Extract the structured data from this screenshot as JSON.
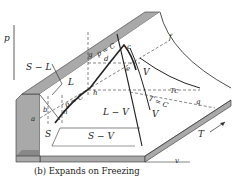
{
  "caption": "(b) Expands on Freezing",
  "axes": {
    "p": "p",
    "v": "v",
    "T": "T"
  },
  "regions": {
    "sl": "S − L",
    "l": "L",
    "lv": "L − V",
    "sv": "S − V",
    "s": "S",
    "v1": "V",
    "v2": "V"
  },
  "points": {
    "a": "a",
    "b": "b",
    "c": "c",
    "d": "d",
    "e": "e",
    "f": "f",
    "g": "g",
    "h": "h",
    "n": "n",
    "q": "q",
    "i": "i",
    "j": "j"
  },
  "isolines": {
    "pc1": "p = C",
    "pc2": "p = C",
    "tc": "T = C",
    "tcrit": "Tc"
  },
  "colors": {
    "surface_shade": "#a9a9a9",
    "line": "#222222"
  }
}
